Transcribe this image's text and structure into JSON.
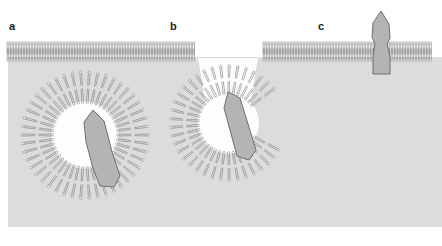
{
  "figure": {
    "width": 442,
    "height": 246,
    "background_color": "#ffffff",
    "cytoplasm_color": "#dcdcdc",
    "lumen_color": "#fdfdfd",
    "lipid_stroke_color": "#7a7a7a",
    "protein_fill_color": "#b4b4b4",
    "protein_stroke_color": "#6e6e6e",
    "label_color": "#1b1b1b"
  },
  "panels": [
    {
      "id": "a",
      "label": "a",
      "caption_text": "a",
      "description": "free cytoplasmic vesicle with cargo protein inside",
      "vesicle": {
        "center_x": 85,
        "center_y": 135,
        "outer_radius": 63,
        "inner_radius": 33,
        "lipid_count": 46
      },
      "protein": {
        "name": "cargo-protein",
        "orientation": "inside-vesicle-lumen",
        "spans_membrane": false
      }
    },
    {
      "id": "b",
      "label": "b",
      "caption_text": "b",
      "description": "vesicle fused with plasma membrane, fusion pore open, protein crossing bilayer",
      "vesicle": {
        "center_x": 228,
        "center_y": 123,
        "outer_radius": 57,
        "inner_radius": 30,
        "lipid_count": 42
      },
      "protein": {
        "name": "cargo-protein",
        "orientation": "crossing-fused-bilayer",
        "spans_membrane": true
      }
    },
    {
      "id": "c",
      "label": "c",
      "caption_text": "c",
      "description": "protein fully inserted into the plasma membrane, ectodomain exposed",
      "protein": {
        "name": "membrane-protein",
        "orientation": "transmembrane-upright",
        "spans_membrane": true,
        "apex_x": 381,
        "apex_y": 12,
        "base_y": 78
      }
    }
  ],
  "membrane": {
    "name": "plasma-membrane",
    "left_x": 8,
    "right_x": 433,
    "top_y": 44,
    "bottom_y": 60,
    "headgroup_side": "bottom",
    "tail_side": "top",
    "lipid_spacing": 3.2,
    "gap_left_x": 196,
    "gap_right_x": 262
  },
  "cytoplasm": {
    "name": "cytoplasm-region",
    "left_x": 8,
    "right_x": 442,
    "top_y": 58,
    "bottom_y": 227
  }
}
